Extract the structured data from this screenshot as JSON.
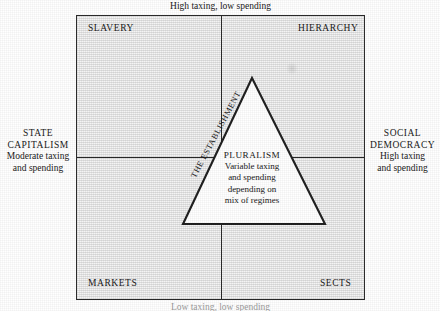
{
  "figure": {
    "axes": {
      "top_caption": "High taxing, low spending",
      "bottom_caption": "Low taxing, low spending",
      "left": {
        "title_line1": "STATE",
        "title_line2": "CAPITALISM",
        "sub_line1": "Moderate taxing",
        "sub_line2": "and spending"
      },
      "right": {
        "title_line1": "SOCIAL",
        "title_line2": "DEMOCRACY",
        "sub_line1": "High taxing",
        "sub_line2": "and spending"
      }
    },
    "quadrants": {
      "top_left": "SLAVERY",
      "top_right": "HIERARCHY",
      "bottom_left": "MARKETS",
      "bottom_right": "SECTS"
    },
    "triangle": {
      "diagonal_label": "THE ESTABLISHMENT",
      "title": "PLURALISM",
      "line1": "Variable taxing",
      "line2": "and spending",
      "line3": "depending on",
      "line4": "mix of regimes"
    },
    "colors": {
      "ink": "#262626",
      "text": "#141414",
      "paper": "#ffffff",
      "panel_fill": "#fbfbfb"
    }
  }
}
